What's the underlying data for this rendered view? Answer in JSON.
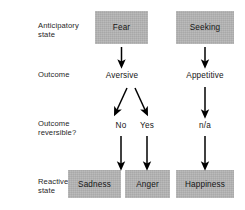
{
  "figure": {
    "type": "flowchart",
    "background_color": "#ffffff",
    "box_fill_color": "#b4b4b4",
    "text_color": "#151515",
    "arrow_color": "#000000"
  },
  "row_labels": [
    {
      "id": "anticipatory-state",
      "text": "Anticipatory\nstate"
    },
    {
      "id": "outcome",
      "text": "Outcome"
    },
    {
      "id": "outcome-reversible",
      "text": "Outcome\nreversible?"
    },
    {
      "id": "reactive-state",
      "text": "Reactive\nstate"
    }
  ],
  "nodes": {
    "anticipatory": [
      {
        "id": "fear",
        "label": "Fear",
        "style": "box"
      },
      {
        "id": "seeking",
        "label": "Seeking",
        "style": "box"
      }
    ],
    "outcome": [
      {
        "id": "aversive",
        "label": "Aversive",
        "style": "plain"
      },
      {
        "id": "appetitive",
        "label": "Appetitive",
        "style": "plain"
      }
    ],
    "reversible": [
      {
        "id": "no",
        "label": "No",
        "style": "plain"
      },
      {
        "id": "yes",
        "label": "Yes",
        "style": "plain"
      },
      {
        "id": "na",
        "label": "n/a",
        "style": "plain"
      }
    ],
    "reactive": [
      {
        "id": "sadness",
        "label": "Sadness",
        "style": "box"
      },
      {
        "id": "anger",
        "label": "Anger",
        "style": "box"
      },
      {
        "id": "happiness",
        "label": "Happiness",
        "style": "box"
      }
    ]
  },
  "edges": [
    {
      "from": "fear",
      "to": "aversive",
      "kind": "vertical-arrow"
    },
    {
      "from": "seeking",
      "to": "appetitive",
      "kind": "vertical-arrow"
    },
    {
      "from": "aversive",
      "to": "no",
      "kind": "diagonal-arrow-left"
    },
    {
      "from": "aversive",
      "to": "yes",
      "kind": "diagonal-arrow-right"
    },
    {
      "from": "appetitive",
      "to": "na",
      "kind": "vertical-arrow"
    },
    {
      "from": "no",
      "to": "sadness",
      "kind": "vertical-arrow"
    },
    {
      "from": "yes",
      "to": "anger",
      "kind": "vertical-arrow"
    },
    {
      "from": "na",
      "to": "happiness",
      "kind": "vertical-arrow"
    }
  ]
}
